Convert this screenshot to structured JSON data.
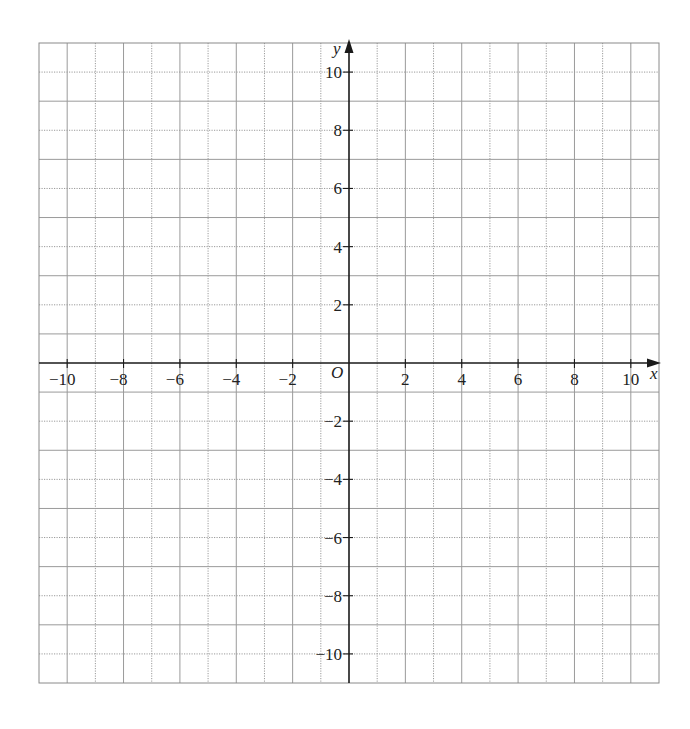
{
  "figure": {
    "type": "coordinate-grid",
    "axes": {
      "x_label": "x",
      "y_label": "y",
      "origin_label": "O",
      "x_range": [
        -11,
        11
      ],
      "y_range": [
        -11,
        11
      ],
      "x_ticks": [
        -10,
        -8,
        -6,
        -4,
        -2,
        2,
        4,
        6,
        8,
        10
      ],
      "y_ticks": [
        -10,
        -8,
        -6,
        -4,
        -2,
        2,
        4,
        6,
        8,
        10
      ],
      "x_tick_labels": [
        "−10",
        "−8",
        "−6",
        "−4",
        "−2",
        "2",
        "4",
        "6",
        "8",
        "10"
      ],
      "y_tick_labels": [
        "−10",
        "−8",
        "−6",
        "−4",
        "−2",
        "2",
        "4",
        "6",
        "8",
        "10"
      ]
    },
    "grid": {
      "step": 1,
      "line_color": "#9a9a9a",
      "axis_color": "#1a1a1a"
    }
  }
}
